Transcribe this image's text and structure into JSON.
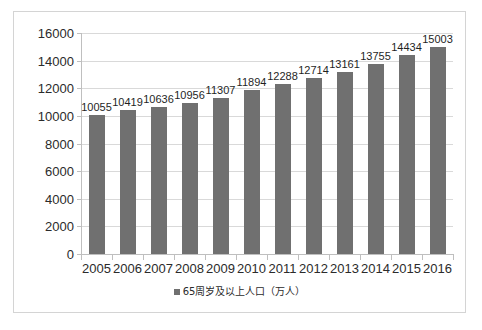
{
  "chart_data": {
    "type": "bar",
    "title": "",
    "xlabel": "",
    "ylabel": "",
    "categories": [
      "2005",
      "2006",
      "2007",
      "2008",
      "2009",
      "2010",
      "2011",
      "2012",
      "2013",
      "2014",
      "2015",
      "2016"
    ],
    "values": [
      10055,
      10419,
      10636,
      10956,
      11307,
      11894,
      12288,
      12714,
      13161,
      13755,
      14434,
      15003
    ],
    "series": [
      {
        "name": "65周岁及以上人口（万人）",
        "values": [
          10055,
          10419,
          10636,
          10956,
          11307,
          11894,
          12288,
          12714,
          13161,
          13755,
          14434,
          15003
        ]
      }
    ],
    "ylim": [
      0,
      16000
    ],
    "ytick_step": 2000,
    "ytick_labels": [
      "0",
      "2000",
      "4000",
      "6000",
      "8000",
      "10000",
      "12000",
      "14000",
      "16000"
    ],
    "grid": true,
    "legend_position": "bottom",
    "legend_entries": [
      "65周岁及以上人口（万人）"
    ],
    "bar_color": "#707070",
    "gridline_color": "#d9d9d9",
    "axis_color": "#bfbfbf",
    "border_color": "#d4d4d4",
    "background_color": "#ffffff",
    "data_labels": [
      "10055",
      "10419",
      "10636",
      "10956",
      "11307",
      "11894",
      "12288",
      "12714",
      "13161",
      "13755",
      "14434",
      "15003"
    ]
  },
  "legend": {
    "swatch_icon": "square-marker-icon",
    "label": "65周岁及以上人口（万人）"
  }
}
